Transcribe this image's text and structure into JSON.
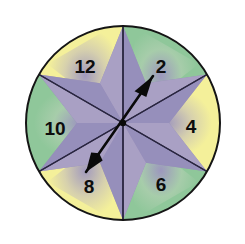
{
  "figure": {
    "name": "spinner-wheel",
    "background_color": "#ffffff"
  },
  "wheel": {
    "center_x": 123,
    "center_y": 123,
    "radius": 97,
    "outline_color": "#151515",
    "outline_width": 2,
    "divider_color": "#2a2640",
    "divider_width": 1.4,
    "sector_count": 6,
    "sectors": [
      {
        "label": "12",
        "start_angle": 270,
        "end_angle": 330,
        "fill": "#8fc79a",
        "label_x": 85,
        "label_y": 66
      },
      {
        "label": "2",
        "start_angle": 330,
        "end_angle": 30,
        "fill": "#f4f09a",
        "label_x": 161,
        "label_y": 66
      },
      {
        "label": "4",
        "start_angle": 30,
        "end_angle": 90,
        "fill": "#8fc79a",
        "label_x": 191,
        "label_y": 126
      },
      {
        "label": "6",
        "start_angle": 90,
        "end_angle": 150,
        "fill": "#f4f09a",
        "label_x": 161,
        "label_y": 184
      },
      {
        "label": "8",
        "start_angle": 150,
        "end_angle": 210,
        "fill": "#8fc79a",
        "label_x": 89,
        "label_y": 186
      },
      {
        "label": "10",
        "start_angle": 210,
        "end_angle": 270,
        "fill": "#f4f09a",
        "label_x": 55,
        "label_y": 128
      }
    ]
  },
  "star": {
    "name": "six-pointed-star",
    "point_count": 6,
    "outer_radius": 97,
    "inner_radius": 46,
    "fill": "#8b84b4",
    "fill_alt": "#9f96c0",
    "shade_fill": "#b3a9c9",
    "tint_fill": "#c9c3dd",
    "rotation_deg": 0
  },
  "pointer": {
    "name": "spinner-arrow",
    "color": "#0a0a0a",
    "tip_x": 153,
    "tip_y": 76,
    "tail_x": 86,
    "tail_y": 172,
    "pivot_x": 123,
    "pivot_y": 123,
    "shaft_width": 2.6,
    "points_to": "2",
    "angle_deg": 35
  },
  "colors": {
    "green": "#8fc79a",
    "yellow": "#f4f09a",
    "purple": "#8b84b4",
    "lavender": "#b3a9c9",
    "tan": "#c4b69c",
    "outline": "#151515",
    "text": "#0d0d0d"
  }
}
